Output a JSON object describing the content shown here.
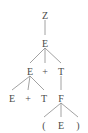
{
  "diagram": {
    "type": "parse-tree",
    "nodes": [
      {
        "id": "n0",
        "label": "Z",
        "x": 45,
        "y": 16
      },
      {
        "id": "n1",
        "label": "E",
        "x": 45,
        "y": 44
      },
      {
        "id": "n2",
        "label": "E",
        "x": 30,
        "y": 72
      },
      {
        "id": "n3",
        "label": "+",
        "x": 45,
        "y": 72
      },
      {
        "id": "n4",
        "label": "T",
        "x": 61,
        "y": 72
      },
      {
        "id": "n5",
        "label": "E",
        "x": 12,
        "y": 99
      },
      {
        "id": "n6",
        "label": "+",
        "x": 28,
        "y": 99
      },
      {
        "id": "n7",
        "label": "T",
        "x": 44,
        "y": 99
      },
      {
        "id": "n8",
        "label": "F",
        "x": 61,
        "y": 99
      },
      {
        "id": "n9",
        "label": "(",
        "x": 44,
        "y": 126
      },
      {
        "id": "n10",
        "label": "E",
        "x": 61,
        "y": 126
      },
      {
        "id": "n11",
        "label": ")",
        "x": 78,
        "y": 126
      }
    ],
    "edges": [
      [
        "n0",
        "n1"
      ],
      [
        "n1",
        "n2"
      ],
      [
        "n1",
        "n3"
      ],
      [
        "n1",
        "n4"
      ],
      [
        "n2",
        "n5"
      ],
      [
        "n2",
        "n6"
      ],
      [
        "n2",
        "n7"
      ],
      [
        "n4",
        "n8"
      ],
      [
        "n8",
        "n9"
      ],
      [
        "n8",
        "n10"
      ],
      [
        "n8",
        "n11"
      ]
    ]
  }
}
